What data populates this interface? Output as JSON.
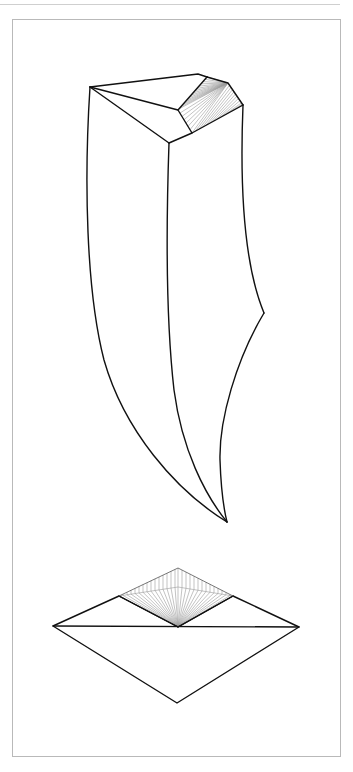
{
  "figure": {
    "kind": "crystal-drawing-plate",
    "views": [
      {
        "id": "clinographic-view",
        "description": "Elongated curved crystal with hatched terminal face"
      },
      {
        "id": "plan-view",
        "description": "Rhombic basal projection with hatched face"
      }
    ],
    "colors": {
      "edge": "#111111",
      "hatch": "#9a9a9a",
      "frame": "#b9b9b9",
      "background": "#ffffff"
    }
  }
}
